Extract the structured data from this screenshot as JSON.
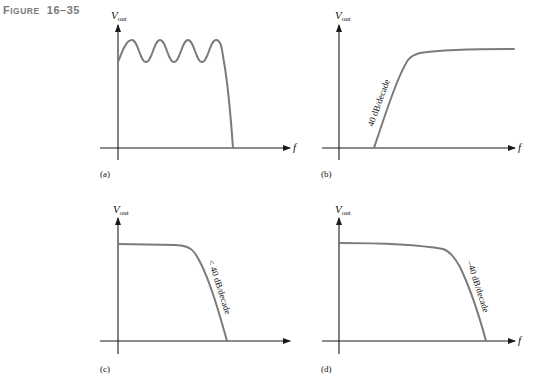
{
  "figure": {
    "title_prefix": "F",
    "title_smallcaps": "IGURE",
    "title_number": "16–35"
  },
  "axes": {
    "y_label_main": "V",
    "y_label_sub": "out",
    "x_label": "f"
  },
  "panels": [
    {
      "id": "a",
      "label": "(a)",
      "response": "Chebyshev low-pass (passband ripple)",
      "slope_label": ""
    },
    {
      "id": "b",
      "label": "(b)",
      "response": "high-pass",
      "slope_label": "40 dB/decade"
    },
    {
      "id": "c",
      "label": "(c)",
      "response": "low-pass",
      "slope_label": "< 40 dB/decade"
    },
    {
      "id": "d",
      "label": "(d)",
      "response": "low-pass",
      "slope_label": "–40 dB/decade"
    }
  ],
  "colors": {
    "curve": "#7b7b7b",
    "axis": "#1a1a1a",
    "title": "#7a7a7a"
  }
}
